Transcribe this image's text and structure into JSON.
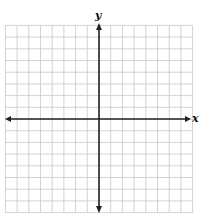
{
  "diagram": {
    "type": "cartesian-coordinate-grid",
    "x_axis_label": "x",
    "y_axis_label": "y",
    "grid": {
      "columns": 16,
      "rows": 16,
      "cell_size_px": 11.7,
      "origin_px": [
        99,
        119
      ],
      "line_color": "#c8c8c8",
      "axis_color": "#222222"
    },
    "axes": {
      "x_arrows": "both",
      "y_arrows": "both"
    }
  }
}
